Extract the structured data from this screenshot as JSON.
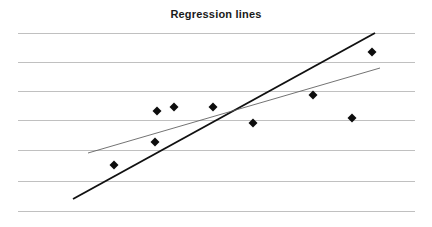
{
  "chart_data": {
    "type": "scatter",
    "title": "Regression lines",
    "subtitle": "",
    "xlabel": "",
    "ylabel": "",
    "grid": true,
    "grid_orientation": "horizontal",
    "gridline_count": 7,
    "legend": false,
    "legend_position": "none",
    "axis_tick_labels": {
      "x": [],
      "y": []
    },
    "xlim": [
      0,
      11
    ],
    "ylim": [
      0,
      6
    ],
    "plot_area_px": {
      "left": 18,
      "right": 415,
      "top": 33,
      "bottom": 211
    },
    "gridlines_y_px": [
      33,
      62,
      91,
      120,
      150,
      181,
      211
    ],
    "points": {
      "name": "Observations",
      "marker": "diamond",
      "marker_color": "#0d0d0d",
      "marker_size_px": 9,
      "x": [
        114,
        155,
        157,
        174,
        213,
        253,
        313,
        352,
        372
      ],
      "y": [
        165,
        142,
        111,
        107,
        107,
        123,
        95,
        118,
        52
      ],
      "count": 9
    },
    "series": [
      {
        "name": "Steep regression line",
        "type": "line",
        "color": "#111111",
        "width_px": 1.9,
        "x1": 73,
        "y1": 199,
        "x2": 375,
        "y2": 33
      },
      {
        "name": "Shallow regression line",
        "type": "line",
        "color": "#5a5a5a",
        "width_px": 0.85,
        "x1": 88,
        "y1": 153,
        "x2": 380,
        "y2": 68
      }
    ],
    "annotations": [],
    "colors": {
      "background": "#ffffff",
      "grid": "#b9b9b9",
      "title": "#1a1a1a",
      "marker": "#0d0d0d",
      "line_primary": "#111111",
      "line_secondary": "#5a5a5a"
    }
  }
}
